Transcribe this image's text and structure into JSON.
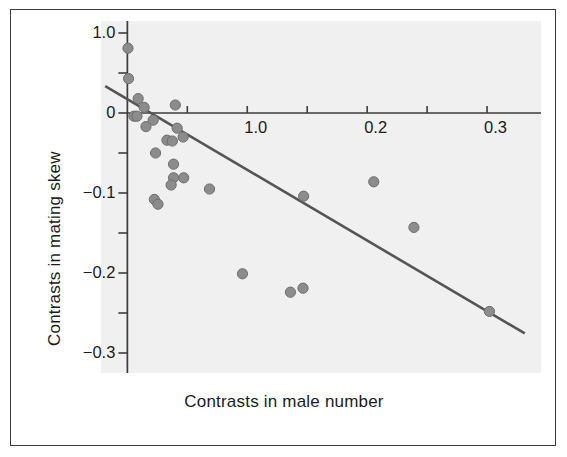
{
  "figure": {
    "background_color": "#ffffff",
    "panel_color": "#f0f0f0",
    "border_color": "#3a3a3a",
    "point_color": "#8c8c8c",
    "point_edge_color": "#6e6e6e",
    "line_color": "#555555",
    "axis_color": "#3d3d3d",
    "text_color": "#1b1b1b"
  },
  "chart_data": {
    "type": "scatter",
    "title": "",
    "xlabel": "Contrasts in male number",
    "ylabel": "Contrasts in mating skew",
    "xlim": [
      -0.022,
      0.345
    ],
    "ylim": [
      -0.325,
      0.115
    ],
    "grid": false,
    "legend": null,
    "x_ticks": [
      0.0,
      0.05,
      0.1,
      0.15,
      0.2,
      0.25,
      0.3
    ],
    "x_tick_labels": [
      "",
      "",
      "1.0",
      "",
      "0.2",
      "",
      "0.3"
    ],
    "y_ticks": [
      0.1,
      0.05,
      0.0,
      -0.05,
      -0.1,
      -0.15,
      -0.2,
      -0.25,
      -0.3
    ],
    "y_tick_labels": [
      "1.0",
      "",
      "0",
      "",
      "-0.1",
      "",
      "-0.2",
      "",
      "-0.3"
    ],
    "points": [
      {
        "x": 0.0005,
        "y": 0.081
      },
      {
        "x": 0.001,
        "y": 0.043
      },
      {
        "x": 0.009,
        "y": 0.018
      },
      {
        "x": 0.014,
        "y": 0.007
      },
      {
        "x": 0.0055,
        "y": -0.004
      },
      {
        "x": 0.008,
        "y": -0.004
      },
      {
        "x": 0.04,
        "y": 0.01
      },
      {
        "x": 0.0215,
        "y": -0.009
      },
      {
        "x": 0.0155,
        "y": -0.017
      },
      {
        "x": 0.0415,
        "y": -0.019
      },
      {
        "x": 0.0465,
        "y": -0.03
      },
      {
        "x": 0.033,
        "y": -0.034
      },
      {
        "x": 0.0375,
        "y": -0.035
      },
      {
        "x": 0.0235,
        "y": -0.05
      },
      {
        "x": 0.0385,
        "y": -0.064
      },
      {
        "x": 0.0385,
        "y": -0.081
      },
      {
        "x": 0.047,
        "y": -0.081
      },
      {
        "x": 0.0365,
        "y": -0.09
      },
      {
        "x": 0.0685,
        "y": -0.095
      },
      {
        "x": 0.147,
        "y": -0.104
      },
      {
        "x": 0.0225,
        "y": -0.108
      },
      {
        "x": 0.0255,
        "y": -0.114
      },
      {
        "x": 0.2055,
        "y": -0.086
      },
      {
        "x": 0.239,
        "y": -0.143
      },
      {
        "x": 0.096,
        "y": -0.201
      },
      {
        "x": 0.136,
        "y": -0.224
      },
      {
        "x": 0.1465,
        "y": -0.219
      },
      {
        "x": 0.302,
        "y": -0.248
      }
    ],
    "regression_line": {
      "x_start": -0.0185,
      "y_start": 0.0335,
      "x_end": 0.3315,
      "y_end": -0.2755
    }
  },
  "labels": {
    "x_title": "Contrasts in male number",
    "y_title": "Contrasts in mating skew",
    "x_ticks": [
      {
        "value": 0.1,
        "text": "1.0"
      },
      {
        "value": 0.2,
        "text": "0.2"
      },
      {
        "value": 0.3,
        "text": "0.3"
      }
    ],
    "y_ticks": [
      {
        "value": 0.1,
        "text": "1.0"
      },
      {
        "value": 0.0,
        "text": "0"
      },
      {
        "value": -0.1,
        "text": "−0.1"
      },
      {
        "value": -0.2,
        "text": "−0.2"
      },
      {
        "value": -0.3,
        "text": "−0.3"
      }
    ]
  }
}
